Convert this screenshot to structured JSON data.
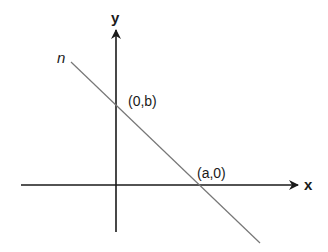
{
  "diagram": {
    "type": "coordinate-plane-line-intercepts",
    "axes": {
      "x_label": "x",
      "y_label": "y",
      "color": "#1a1a1a"
    },
    "line": {
      "label": "n",
      "color": "#777777"
    },
    "points": {
      "y_intercept": "(0,b)",
      "x_intercept": "(a,0)"
    }
  }
}
